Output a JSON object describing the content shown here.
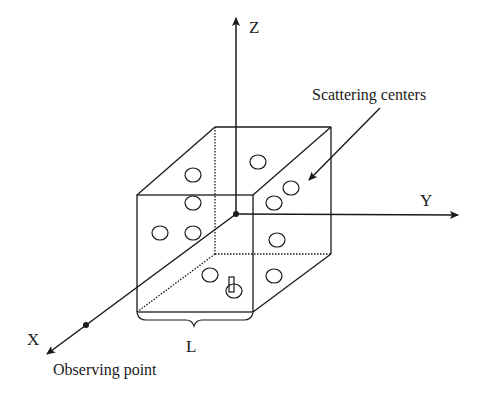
{
  "diagram": {
    "axes": {
      "z_label": "Z",
      "y_label": "Y",
      "x_label": "X"
    },
    "labels": {
      "scattering": "Scattering centers",
      "length": "L",
      "observer": "Observing point"
    },
    "colors": {
      "stroke": "#1a1a1a",
      "background": "#ffffff"
    }
  }
}
